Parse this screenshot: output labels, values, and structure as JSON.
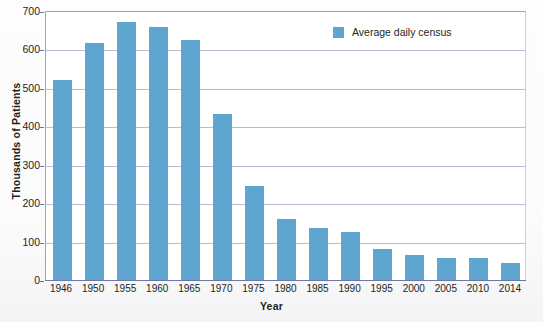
{
  "chart_data": {
    "type": "bar",
    "title": "",
    "xlabel": "Year",
    "ylabel": "Thousands of Patients",
    "categories": [
      "1946",
      "1950",
      "1955",
      "1960",
      "1965",
      "1970",
      "1975",
      "1980",
      "1985",
      "1990",
      "1995",
      "2000",
      "2005",
      "2010",
      "2014"
    ],
    "series": [
      {
        "name": "Average daily census",
        "color": "#5ea6d0",
        "values": [
          520,
          617,
          672,
          658,
          625,
          432,
          245,
          158,
          136,
          124,
          80,
          66,
          56,
          58,
          45
        ]
      }
    ],
    "ylim": [
      0,
      700
    ],
    "y_ticks": [
      0,
      100,
      200,
      300,
      400,
      500,
      600,
      700
    ],
    "y_tick_labels": [
      "0",
      "100",
      "200",
      "300",
      "400",
      "500",
      "600",
      "700"
    ],
    "grid": "horizontal",
    "legend_position": "top-right",
    "legend_entries": [
      "Average daily census"
    ]
  },
  "legend": {
    "swatch_name": "legend-color-swatch",
    "label": "Average daily census"
  }
}
